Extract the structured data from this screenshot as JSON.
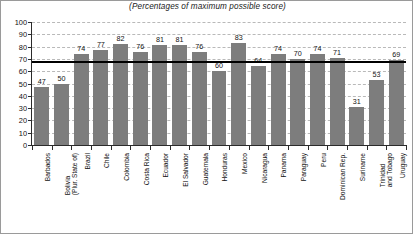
{
  "chart_data": {
    "type": "bar",
    "title": "(Percentages of maximum possible score)",
    "xlabel": "",
    "ylabel": "",
    "ylim": [
      0,
      100
    ],
    "ytick_step": 10,
    "yticks": [
      0,
      10,
      20,
      30,
      40,
      50,
      60,
      70,
      80,
      90,
      100
    ],
    "ytick_labels": [
      "0",
      "10",
      "20",
      "30",
      "40",
      "50",
      "60",
      "70",
      "80",
      "90",
      "100"
    ],
    "grid": true,
    "grid_style": "dashed-horizontal",
    "legend": "none",
    "bar_color": "#7d7d7d",
    "reference_line": {
      "value": 68,
      "color": "#000000",
      "label": ""
    },
    "categories": [
      "Barbados",
      "Bolivia (Plur. State of)",
      "Brazil",
      "Chile",
      "Colombia",
      "Costa Rica",
      "Ecuador",
      "El Salvador",
      "Guatemala",
      "Honduras",
      "Mexico",
      "Nicaragua",
      "Panama",
      "Paraguay",
      "Peru",
      "Dominican Rep.",
      "Suriname",
      "Trinidad and Tobago",
      "Uruguay"
    ],
    "category_lines": [
      [
        "Barbados"
      ],
      [
        "Bolivia",
        "(Plur. State of)"
      ],
      [
        "Brazil"
      ],
      [
        "Chile"
      ],
      [
        "Colombia"
      ],
      [
        "Costa Rica"
      ],
      [
        "Ecuador"
      ],
      [
        "El Salvador"
      ],
      [
        "Guatemala"
      ],
      [
        "Honduras"
      ],
      [
        "Mexico"
      ],
      [
        "Nicaragua"
      ],
      [
        "Panama"
      ],
      [
        "Paraguay"
      ],
      [
        "Peru"
      ],
      [
        "Dominican Rep."
      ],
      [
        "Suriname"
      ],
      [
        "Trinidad",
        "and Tobago"
      ],
      [
        "Uruguay"
      ]
    ],
    "values": [
      47,
      50,
      74,
      77,
      82,
      76,
      81,
      81,
      76,
      60,
      83,
      64,
      74,
      70,
      74,
      71,
      31,
      53,
      69
    ],
    "value_labels": [
      "47",
      "50",
      "74",
      "77",
      "82",
      "76",
      "81",
      "81",
      "76",
      "60",
      "83",
      "64",
      "74",
      "70",
      "74",
      "71",
      "31",
      "53",
      "69"
    ]
  }
}
